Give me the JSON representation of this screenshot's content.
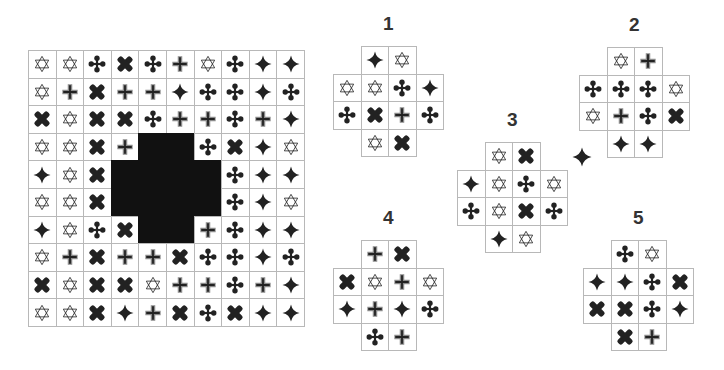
{
  "legend": {
    "S": "star-of-david-outline",
    "P": "gray-plus",
    "X": "bold-x-cross",
    "C": "club-cross",
    "D": "four-point-star",
    "#": "missing-dark-cell",
    ".": "no-cell"
  },
  "colors": {
    "symbol": "#222222",
    "plus_border": "#8a8a8a",
    "grid_line": "#b8b8b8",
    "dark": "#111111",
    "label": "#333333"
  },
  "main_grid": {
    "x": 28,
    "y": 50,
    "cell": 27.6,
    "rows": [
      "SSCXCPSCDD",
      "SPXPPDCCDC",
      "XSXXCPPCPD",
      "SSXP##CXDS",
      "DSX####CDD",
      "SSX####CDS",
      "DSCX##PCDD",
      "SPXPPXCCDC",
      "XSXXSPPCPD",
      "SSXDPXCXDD"
    ]
  },
  "options": [
    {
      "label": "1",
      "x": 333,
      "y": 46,
      "cell": 27.6,
      "rows": [
        ".DS.",
        "SSCD",
        "CXPC",
        ".SX."
      ]
    },
    {
      "label": "2",
      "x": 579,
      "y": 47,
      "cell": 27.6,
      "rows": [
        ".SP.",
        "CCCS",
        "SPCX",
        ".DD."
      ]
    },
    {
      "label": "3",
      "x": 457,
      "y": 142,
      "cell": 27.6,
      "rows": [
        ".SX.",
        "DSCS",
        "CSXC",
        ".DS."
      ]
    },
    {
      "label": "4",
      "x": 333,
      "y": 240,
      "cell": 27.6,
      "rows": [
        ".PX.",
        "XSPS",
        "DPDC",
        ".CP."
      ]
    },
    {
      "label": "5",
      "x": 583,
      "y": 240,
      "cell": 27.6,
      "rows": [
        ".CS.",
        "DDCX",
        "XXCD",
        ".XP."
      ]
    }
  ],
  "floating_symbol": {
    "type": "D",
    "x": 572,
    "y": 147
  }
}
